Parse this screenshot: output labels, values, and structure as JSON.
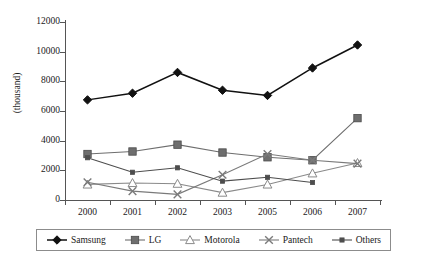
{
  "chart_data": {
    "type": "line",
    "title": "",
    "subtitle": "",
    "xlabel": "",
    "ylabel": "(thousand)",
    "categories": [
      "2000",
      "2001",
      "2002",
      "2003",
      "2005",
      "2006",
      "2007"
    ],
    "x": [
      2000,
      2001,
      2002,
      2003,
      2005,
      2006,
      2007
    ],
    "ylim": [
      0,
      12000
    ],
    "yticks": [
      0,
      2000,
      4000,
      6000,
      8000,
      10000,
      12000
    ],
    "ytick_labels": [
      "0",
      "2000",
      "4000",
      "6000",
      "8000",
      "10000",
      "12000"
    ],
    "grid": false,
    "legend_position": "bottom",
    "series": [
      {
        "name": "Samsung",
        "marker": "diamond",
        "color": "#111111",
        "values": [
          6750,
          7200,
          8600,
          7400,
          7050,
          8900,
          10450
        ]
      },
      {
        "name": "LG",
        "marker": "square",
        "color": "#6e6e6e",
        "values": [
          3100,
          3270,
          3730,
          3200,
          2880,
          2680,
          5520
        ]
      },
      {
        "name": "Motorola",
        "marker": "triangle-open",
        "color": "#8a8a8a",
        "values": [
          1050,
          1150,
          1100,
          500,
          1050,
          1800,
          2500
        ]
      },
      {
        "name": "Pantech",
        "marker": "x",
        "color": "#7a7a7a",
        "values": [
          1200,
          600,
          380,
          1700,
          3100,
          2680,
          2450
        ]
      },
      {
        "name": "Others",
        "marker": "small-square",
        "color": "#4d4d4d",
        "values": [
          2850,
          1870,
          2170,
          1270,
          1530,
          1180,
          null
        ]
      }
    ]
  },
  "axes": {
    "y_axis_label": "(thousand)",
    "y_tick_labels": [
      "12000",
      "10000",
      "8000",
      "6000",
      "4000",
      "2000",
      "0"
    ],
    "x_tick_labels": [
      "2000",
      "2001",
      "2002",
      "2003",
      "2005",
      "2006",
      "2007"
    ]
  },
  "legend": {
    "entries": [
      {
        "label": "Samsung",
        "icon": "diamond-marker-icon"
      },
      {
        "label": "LG",
        "icon": "square-marker-icon"
      },
      {
        "label": "Motorola",
        "icon": "triangle-marker-icon"
      },
      {
        "label": "Pantech",
        "icon": "x-marker-icon"
      },
      {
        "label": "Others",
        "icon": "small-square-marker-icon"
      }
    ]
  },
  "colors": {
    "samsung": "#111111",
    "lg": "#6e6e6e",
    "motorola": "#8a8a8a",
    "pantech": "#7a7a7a",
    "others": "#4d4d4d",
    "axis": "#555555",
    "text": "#1a1a1a",
    "legend_border": "#8c8c8c"
  }
}
